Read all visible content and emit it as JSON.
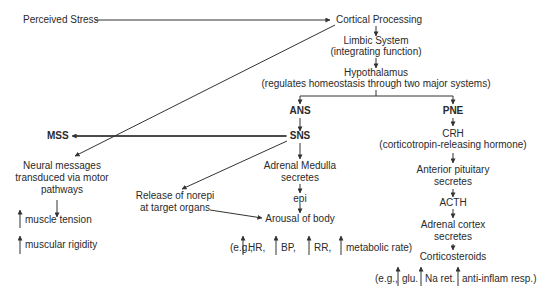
{
  "diagram": {
    "nodes": {
      "perceived_stress": "Perceived Stress",
      "cortical_processing": "Cortical Processing",
      "limbic_system": "Limbic System",
      "limbic_function": "(integrating function)",
      "hypothalamus": "Hypothalamus",
      "hypothalamus_desc": "(regulates homeostasis through two major systems)",
      "ans": "ANS",
      "pne": "PNE",
      "sns": "SNS",
      "mss": "MSS",
      "crh": "CRH",
      "crh_desc": "(corticotropin-releasing hormone)",
      "adrenal_medulla_1": "Adrenal Medulla",
      "adrenal_medulla_2": "secretes",
      "epi": "epi",
      "release_norepi_1": "Release of norepi",
      "release_norepi_2": "at target organs",
      "arousal": "Arousal of body",
      "neural_1": "Neural messages",
      "neural_2": "transduced via motor",
      "neural_3": "pathways",
      "muscle_tension": "muscle tension",
      "muscular_rigidity": "muscular rigidity",
      "anterior_pituitary_1": "Anterior pituitary",
      "anterior_pituitary_2": "secretes",
      "acth": "ACTH",
      "adrenal_cortex_1": "Adrenal cortex",
      "adrenal_cortex_2": "secretes",
      "corticosteroids": "Corticosteroids"
    },
    "arousal_examples": {
      "prefix": "(e.g.,",
      "items": [
        "HR,",
        "BP,",
        "RR,",
        "metabolic rate)"
      ]
    },
    "corticosteroid_examples": {
      "prefix": "(e.g.,",
      "items": [
        "glu.",
        "Na ret.",
        "anti-inflam resp.)"
      ]
    }
  }
}
